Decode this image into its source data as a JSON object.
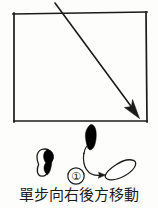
{
  "figure": {
    "title_caption": "單步向右後方移動",
    "step_marker": "①",
    "ink_color": "#1b1b1b",
    "fill_color": "#000000",
    "background_color": "#fdfdfc",
    "floor_area": {
      "name": "practice-floor-rectangle",
      "left": 13,
      "top": 13,
      "right": 147,
      "bottom": 122
    },
    "direction_arrow": {
      "name": "diagonal-direction-arrow",
      "from_x": 55,
      "from_y": 3,
      "to_x": 139,
      "to_y": 117,
      "label": ""
    },
    "footprints": [
      {
        "name": "left-foot-outline",
        "style": "outline",
        "position": "lower-left",
        "cx": 45,
        "cy": 162
      },
      {
        "name": "right-foot-solid-start",
        "style": "solid",
        "position": "upper-center",
        "cx": 91,
        "cy": 137
      },
      {
        "name": "right-foot-outline-end",
        "style": "outline-oval",
        "position": "lower-right",
        "cx": 117,
        "cy": 170
      }
    ],
    "movement_path": {
      "name": "step-movement-arrow",
      "from": "right-foot-solid-start",
      "to": "right-foot-outline-end"
    }
  }
}
